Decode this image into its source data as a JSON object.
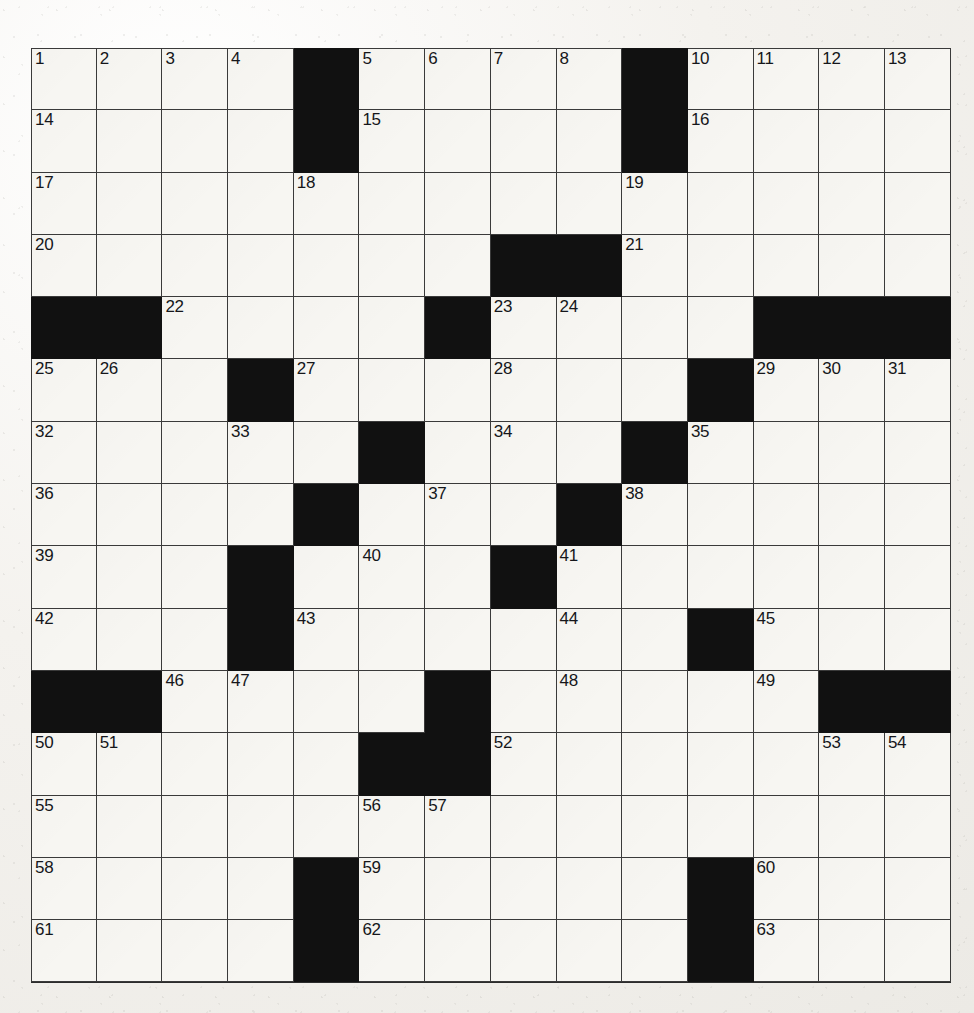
{
  "puzzle": {
    "type": "crossword-grid",
    "columns": 14,
    "rows": 15,
    "grid_left": 31,
    "grid_top": 48,
    "cell_width": 65.7,
    "cell_height": 62.3,
    "colors": {
      "paper": "#f2f0ec",
      "cell_fill": "#f7f6f2",
      "block_fill": "#111111",
      "grid_line": "#3a3a3a",
      "number_text": "#15161a"
    },
    "highest_clue_number": 63,
    "black_square_count": 38,
    "blocks": [
      [
        0,
        4
      ],
      [
        0,
        9
      ],
      [
        1,
        4
      ],
      [
        1,
        9
      ],
      [
        3,
        7
      ],
      [
        3,
        8
      ],
      [
        4,
        0
      ],
      [
        4,
        1
      ],
      [
        4,
        6
      ],
      [
        4,
        11
      ],
      [
        4,
        12
      ],
      [
        4,
        13
      ],
      [
        5,
        3
      ],
      [
        5,
        10
      ],
      [
        6,
        5
      ],
      [
        6,
        9
      ],
      [
        7,
        4
      ],
      [
        7,
        8
      ],
      [
        8,
        3
      ],
      [
        8,
        7
      ],
      [
        9,
        3
      ],
      [
        9,
        10
      ],
      [
        10,
        0
      ],
      [
        10,
        1
      ],
      [
        10,
        6
      ],
      [
        10,
        12
      ],
      [
        10,
        13
      ],
      [
        11,
        5
      ],
      [
        11,
        6
      ],
      [
        13,
        4
      ],
      [
        13,
        10
      ],
      [
        14,
        4
      ],
      [
        14,
        10
      ]
    ],
    "numbers": [
      {
        "row": 0,
        "col": 0,
        "n": "1"
      },
      {
        "row": 0,
        "col": 1,
        "n": "2"
      },
      {
        "row": 0,
        "col": 2,
        "n": "3"
      },
      {
        "row": 0,
        "col": 3,
        "n": "4"
      },
      {
        "row": 0,
        "col": 5,
        "n": "5"
      },
      {
        "row": 0,
        "col": 6,
        "n": "6"
      },
      {
        "row": 0,
        "col": 7,
        "n": "7"
      },
      {
        "row": 0,
        "col": 8,
        "n": "8"
      },
      {
        "row": 0,
        "col": 9,
        "n": "9"
      },
      {
        "row": 0,
        "col": 10,
        "n": "10"
      },
      {
        "row": 0,
        "col": 11,
        "n": "11"
      },
      {
        "row": 0,
        "col": 12,
        "n": "12"
      },
      {
        "row": 0,
        "col": 13,
        "n": "13"
      },
      {
        "row": 1,
        "col": 0,
        "n": "14"
      },
      {
        "row": 1,
        "col": 5,
        "n": "15"
      },
      {
        "row": 1,
        "col": 10,
        "n": "16"
      },
      {
        "row": 2,
        "col": 0,
        "n": "17"
      },
      {
        "row": 2,
        "col": 4,
        "n": "18"
      },
      {
        "row": 2,
        "col": 9,
        "n": "19"
      },
      {
        "row": 3,
        "col": 0,
        "n": "20"
      },
      {
        "row": 3,
        "col": 9,
        "n": "21"
      },
      {
        "row": 4,
        "col": 2,
        "n": "22"
      },
      {
        "row": 4,
        "col": 7,
        "n": "23"
      },
      {
        "row": 4,
        "col": 8,
        "n": "24"
      },
      {
        "row": 5,
        "col": 0,
        "n": "25"
      },
      {
        "row": 5,
        "col": 1,
        "n": "26"
      },
      {
        "row": 5,
        "col": 4,
        "n": "27"
      },
      {
        "row": 5,
        "col": 7,
        "n": "28"
      },
      {
        "row": 5,
        "col": 11,
        "n": "29"
      },
      {
        "row": 5,
        "col": 12,
        "n": "30"
      },
      {
        "row": 5,
        "col": 13,
        "n": "31"
      },
      {
        "row": 6,
        "col": 0,
        "n": "32"
      },
      {
        "row": 6,
        "col": 3,
        "n": "33"
      },
      {
        "row": 6,
        "col": 7,
        "n": "34"
      },
      {
        "row": 6,
        "col": 10,
        "n": "35"
      },
      {
        "row": 7,
        "col": 0,
        "n": "36"
      },
      {
        "row": 7,
        "col": 6,
        "n": "37"
      },
      {
        "row": 7,
        "col": 9,
        "n": "38"
      },
      {
        "row": 8,
        "col": 0,
        "n": "39"
      },
      {
        "row": 8,
        "col": 5,
        "n": "40"
      },
      {
        "row": 8,
        "col": 8,
        "n": "41"
      },
      {
        "row": 9,
        "col": 0,
        "n": "42"
      },
      {
        "row": 9,
        "col": 4,
        "n": "43"
      },
      {
        "row": 9,
        "col": 8,
        "n": "44"
      },
      {
        "row": 9,
        "col": 11,
        "n": "45"
      },
      {
        "row": 10,
        "col": 2,
        "n": "46"
      },
      {
        "row": 10,
        "col": 3,
        "n": "47"
      },
      {
        "row": 10,
        "col": 8,
        "n": "48"
      },
      {
        "row": 10,
        "col": 11,
        "n": "49"
      },
      {
        "row": 11,
        "col": 0,
        "n": "50"
      },
      {
        "row": 11,
        "col": 1,
        "n": "51"
      },
      {
        "row": 11,
        "col": 7,
        "n": "52"
      },
      {
        "row": 11,
        "col": 12,
        "n": "53"
      },
      {
        "row": 11,
        "col": 13,
        "n": "54"
      },
      {
        "row": 12,
        "col": 0,
        "n": "55"
      },
      {
        "row": 12,
        "col": 5,
        "n": "56"
      },
      {
        "row": 12,
        "col": 6,
        "n": "57"
      },
      {
        "row": 13,
        "col": 0,
        "n": "58"
      },
      {
        "row": 13,
        "col": 5,
        "n": "59"
      },
      {
        "row": 13,
        "col": 11,
        "n": "60"
      },
      {
        "row": 14,
        "col": 0,
        "n": "61"
      },
      {
        "row": 14,
        "col": 5,
        "n": "62"
      },
      {
        "row": 14,
        "col": 11,
        "n": "63"
      }
    ],
    "entries": []
  }
}
